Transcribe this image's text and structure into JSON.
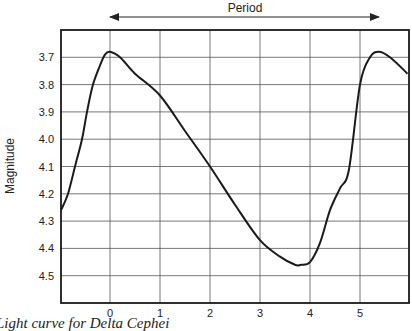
{
  "chart_data": {
    "type": "line",
    "title": "",
    "annotation": "Period",
    "xlabel": "",
    "ylabel": "Magnitude",
    "x_ticks": [
      0,
      1,
      2,
      3,
      4,
      5
    ],
    "y_ticks": [
      3.7,
      3.8,
      3.9,
      4.0,
      4.1,
      4.2,
      4.3,
      4.4,
      4.5
    ],
    "y_tick_labels": [
      "3.7",
      "3.8",
      "3.9",
      "4.0",
      "4.1",
      "4.2",
      "4.3",
      "4.4",
      "4.5"
    ],
    "xlim": [
      -0.98,
      5.98
    ],
    "ylim": [
      4.6,
      3.6
    ],
    "y_inverted": true,
    "grid": true,
    "legend": null,
    "series": [
      {
        "name": "Light curve",
        "x": [
          -0.98,
          -0.84,
          -0.7,
          -0.56,
          -0.46,
          -0.34,
          -0.2,
          -0.1,
          0.0,
          0.2,
          0.5,
          1.0,
          1.5,
          2.0,
          2.5,
          3.0,
          3.4,
          3.7,
          3.82,
          4.0,
          4.2,
          4.4,
          4.6,
          4.78,
          5.0,
          5.2,
          5.38,
          5.6,
          5.95
        ],
        "y": [
          4.26,
          4.2,
          4.1,
          4.0,
          3.9,
          3.8,
          3.73,
          3.69,
          3.68,
          3.7,
          3.76,
          3.84,
          3.97,
          4.1,
          4.24,
          4.37,
          4.43,
          4.46,
          4.46,
          4.45,
          4.38,
          4.26,
          4.18,
          4.11,
          3.8,
          3.7,
          3.68,
          3.7,
          3.76
        ]
      }
    ],
    "period_arrow": {
      "from": 0,
      "to": 5.38
    }
  },
  "labels": {
    "period": "Period",
    "ylabel": "Magnitude",
    "caption": "Light curve for Delta Cephei"
  }
}
